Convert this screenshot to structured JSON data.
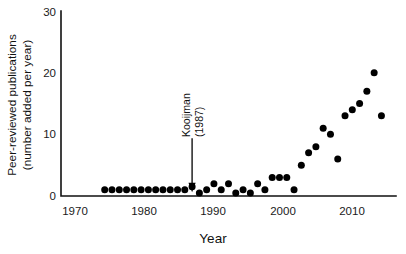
{
  "chart_data": {
    "type": "scatter",
    "title": "",
    "xlabel": "Year",
    "ylabel": "Peer-reviewed publications (number added per year)",
    "ylabel_line1": "Peer-reviewed publications",
    "ylabel_line2": "(number added per year)",
    "xlim": [
      1969,
      2015
    ],
    "ylim": [
      0,
      30
    ],
    "grid": false,
    "legend": "none",
    "xticks": [
      1970,
      1980,
      1990,
      2000,
      2010
    ],
    "xtick_labels": [
      "1970",
      "1980",
      "1990",
      "2000",
      "2010"
    ],
    "yticks": [
      0,
      10,
      20,
      30
    ],
    "ytick_labels": [
      "0",
      "10",
      "20",
      "30"
    ],
    "marker": "filled-circle",
    "marker_color": "#000000",
    "x": [
      1975,
      1976,
      1977,
      1978,
      1979,
      1980,
      1981,
      1982,
      1983,
      1984,
      1985,
      1986,
      1987,
      1988,
      1989,
      1990,
      1991,
      1992,
      1993,
      1994,
      1995,
      1996,
      1997,
      1998,
      1999,
      2000,
      2001,
      2002,
      2003,
      2004,
      2005,
      2006,
      2007,
      2008,
      2009,
      2010,
      2011,
      2012,
      2013
    ],
    "y": [
      1,
      1,
      1,
      1,
      1,
      1,
      1,
      1,
      1,
      1,
      1,
      1,
      1.5,
      0.5,
      1,
      2,
      1,
      2,
      0.5,
      1,
      0.5,
      2,
      1,
      3,
      3,
      3,
      1,
      5,
      7,
      8,
      11,
      10,
      6,
      13,
      14,
      15,
      17,
      20,
      13
    ],
    "annotations": [
      {
        "name": "kooijman-1987",
        "label_line1": "Kooijman",
        "label_line2": "(1987)",
        "target_x": 1987,
        "target_y": 0.6,
        "arrow": "down"
      }
    ]
  }
}
